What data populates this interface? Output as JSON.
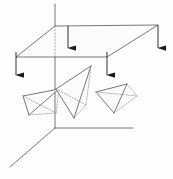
{
  "figure": {
    "background_color": "#fdfdfd",
    "line_color": "#555555",
    "hidden_line_color": "#999999",
    "arrow_color": "#1a1a1a",
    "face_fill": "#fcfcfc",
    "stroke_width": 0.8
  },
  "axes": {
    "vertical_axis": {
      "name": "z-axis",
      "visible_top": {
        "x1": 55,
        "y1": 4,
        "x2": 55,
        "y2": 26
      },
      "hidden_segment": {
        "x1": 55,
        "y1": 26,
        "x2": 55,
        "y2": 57
      },
      "lower_segment": {
        "x1": 55,
        "y1": 57,
        "x2": 55,
        "y2": 128
      }
    },
    "horizontal_axis": {
      "name": "y-axis",
      "x1": 55,
      "y1": 128,
      "x2": 133,
      "y2": 128
    },
    "depth_axis": {
      "name": "x-axis",
      "x1": 55,
      "y1": 128,
      "x2": 10,
      "y2": 167
    },
    "origin": {
      "x": 55,
      "y": 128
    }
  },
  "plane": {
    "name": "horizontal-plane",
    "corners": [
      {
        "label": "far-left",
        "x": 55,
        "y": 26
      },
      {
        "label": "far-right",
        "x": 158,
        "y": 25
      },
      {
        "label": "near-right",
        "x": 107,
        "y": 57
      },
      {
        "label": "near-left",
        "x": 16,
        "y": 57
      }
    ]
  },
  "arrows": [
    {
      "name": "flux-arrow-1",
      "x": 16,
      "y_start": 52,
      "y_end": 75,
      "label": ""
    },
    {
      "name": "flux-arrow-2",
      "x": 68,
      "y_start": 26,
      "y_end": 48,
      "label": ""
    },
    {
      "name": "flux-arrow-3",
      "x": 107,
      "y_start": 52,
      "y_end": 75,
      "label": ""
    },
    {
      "name": "flux-arrow-4",
      "x": 158,
      "y_start": 25,
      "y_end": 48,
      "label": ""
    }
  ],
  "tetrahedra": [
    {
      "name": "tetrahedron-left",
      "vertices": {
        "a": {
          "x": 23,
          "y": 96
        },
        "b": {
          "x": 29,
          "y": 115
        },
        "c": {
          "x": 56,
          "y": 113
        },
        "d": {
          "x": 59,
          "y": 89
        }
      },
      "hidden_vertex": "c"
    },
    {
      "name": "tetrahedron-middle",
      "vertices": {
        "a": {
          "x": 56,
          "y": 89
        },
        "b": {
          "x": 91,
          "y": 66
        },
        "c": {
          "x": 86,
          "y": 105
        },
        "d": {
          "x": 74,
          "y": 118
        }
      },
      "hidden_vertex": "c"
    },
    {
      "name": "tetrahedron-right",
      "vertices": {
        "a": {
          "x": 96,
          "y": 92
        },
        "b": {
          "x": 127,
          "y": 84
        },
        "c": {
          "x": 137,
          "y": 96
        },
        "d": {
          "x": 114,
          "y": 113
        }
      },
      "hidden_vertex": "c"
    }
  ]
}
